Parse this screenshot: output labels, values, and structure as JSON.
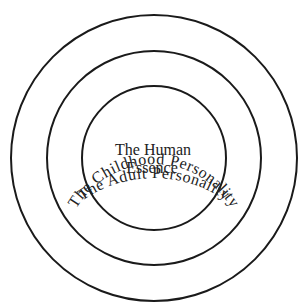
{
  "diagram": {
    "type": "concentric-circles",
    "center": {
      "x": 154,
      "y": 158
    },
    "rings": [
      {
        "name": "outer",
        "radius": 143,
        "label": "The Adult Personality"
      },
      {
        "name": "middle",
        "radius": 107,
        "label": "The Childhood Personality"
      },
      {
        "name": "inner",
        "radius": 72,
        "label_lines": [
          "The Human",
          "Essence"
        ]
      }
    ],
    "colors": {
      "stroke": "#1a1a1a",
      "text": "#222222",
      "background": "#ffffff"
    }
  }
}
